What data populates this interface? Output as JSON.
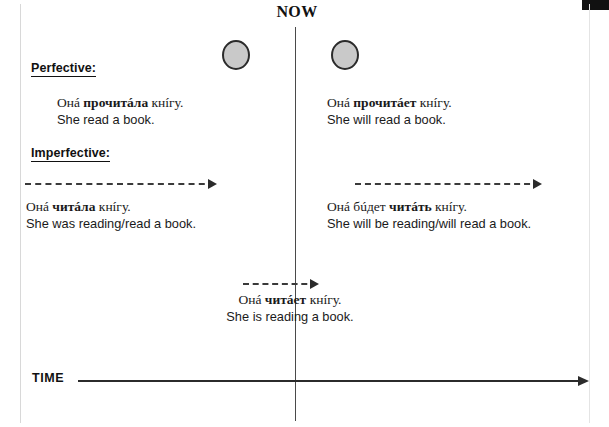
{
  "diagram": {
    "now_label": "NOW",
    "time_label": "TIME",
    "headings": {
      "perfective": "Perfective:",
      "imperfective": "Imperfective:"
    },
    "sentences": {
      "perfective_past": {
        "ru_pre": "Онá ",
        "ru_bold": "прочитáла",
        "ru_post": " кнíгу.",
        "ru_full": "Онá прочитáла кнíгу.",
        "en": "She read a book."
      },
      "perfective_future": {
        "ru_pre": "Онá ",
        "ru_bold": "прочитáет",
        "ru_post": " кнíгу.",
        "ru_full": "Онá прочитáет кнíгу.",
        "en": "She will read a book."
      },
      "imperfective_past": {
        "ru_pre": "Онá ",
        "ru_bold": "читáла",
        "ru_post": " кнíгу.",
        "ru_full": "Онá читáла кнíгу.",
        "en": "She was reading/read a book."
      },
      "imperfective_future": {
        "ru_pre": "Онá бúдет ",
        "ru_bold": "читáть",
        "ru_post": " кнíгу.",
        "ru_full": "Онá бúдет читáть кнíгу.",
        "en": "She will be reading/will read a book."
      },
      "imperfective_present": {
        "ru_pre": "Онá ",
        "ru_bold": "читáет",
        "ru_post": " кнíгу.",
        "ru_full": "Онá читáет кнíгу.",
        "en": "She is reading a book."
      }
    },
    "markers": {
      "perfective_past_event": "completed-event-circle-past",
      "perfective_future_event": "completed-event-circle-future"
    },
    "colors": {
      "ink": "#1a1a1a",
      "line": "#2b2b2b",
      "circle_fill": "#c9c9c9",
      "circle_stroke": "#2b2b2b",
      "now_line": "#4a4a4a",
      "background": "#ffffff"
    }
  }
}
